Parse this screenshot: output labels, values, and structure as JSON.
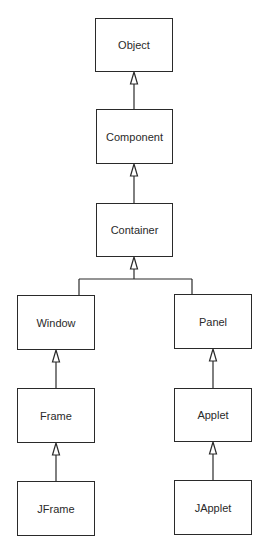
{
  "diagram": {
    "type": "class-hierarchy",
    "nodes": [
      {
        "id": "object",
        "label": "Object"
      },
      {
        "id": "component",
        "label": "Component"
      },
      {
        "id": "container",
        "label": "Container"
      },
      {
        "id": "window",
        "label": "Window"
      },
      {
        "id": "panel",
        "label": "Panel"
      },
      {
        "id": "frame",
        "label": "Frame"
      },
      {
        "id": "applet",
        "label": "Applet"
      },
      {
        "id": "jframe",
        "label": "JFrame"
      },
      {
        "id": "japplet",
        "label": "JApplet"
      }
    ],
    "edges": [
      {
        "from": "Component",
        "to": "Object",
        "kind": "inheritance"
      },
      {
        "from": "Container",
        "to": "Component",
        "kind": "inheritance"
      },
      {
        "from": "Window",
        "to": "Container",
        "kind": "inheritance"
      },
      {
        "from": "Panel",
        "to": "Container",
        "kind": "inheritance"
      },
      {
        "from": "Frame",
        "to": "Window",
        "kind": "inheritance"
      },
      {
        "from": "Applet",
        "to": "Panel",
        "kind": "inheritance"
      },
      {
        "from": "JFrame",
        "to": "Frame",
        "kind": "inheritance"
      },
      {
        "from": "JApplet",
        "to": "Applet",
        "kind": "inheritance"
      }
    ]
  }
}
